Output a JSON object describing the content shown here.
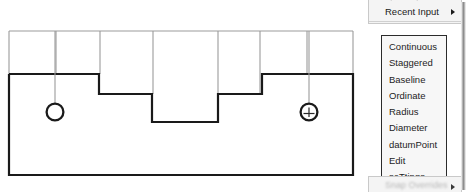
{
  "drawing": {
    "title": "stepped-plate-orthographic-view",
    "line_color": "#1a1a1a",
    "extension_line_color": "#9b9b9b",
    "hole_marker_color": "#1a1a1a",
    "profile_outline_width_px": 2.2,
    "extension_line_width_px": 1,
    "top_band": {
      "top_y": 31,
      "bottom_y": 74,
      "left_x": 9,
      "right_x": 353,
      "vertical_divider_x": [
        9,
        56,
        100,
        153,
        218,
        260,
        307,
        353
      ]
    },
    "profile_points": "9,74 99,74 99,94 152,94 152,122 218,122 218,94 262,94 262,74 353,74 353,175 9,175 9,74",
    "holes": [
      {
        "name": "left-hole",
        "cx": 55,
        "cy": 112,
        "r": 8.5,
        "leader_from_y": 31,
        "has_crosshair": false
      },
      {
        "name": "right-hole",
        "cx": 309,
        "cy": 112,
        "r": 8.5,
        "leader_from_y": 31,
        "has_crosshair": true
      }
    ]
  },
  "parent_menu": {
    "items": [
      {
        "label": "Spline Input",
        "clipped": true,
        "has_submenu": false
      },
      {
        "label": "Recent Input",
        "clipped": false,
        "has_submenu": true
      }
    ],
    "bottom_item": {
      "label": "Snap Overrides",
      "has_submenu": true
    }
  },
  "submenu": {
    "name": "dimension-style-submenu",
    "items": [
      "Continuous",
      "Staggered",
      "Baseline",
      "Ordinate",
      "Radius",
      "Diameter",
      "datumPoint",
      "Edit",
      "seTtings"
    ]
  },
  "scrollbar": {
    "name": "vertical-scrollbar",
    "orientation": "vertical"
  }
}
